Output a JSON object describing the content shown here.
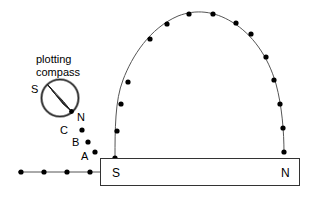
{
  "figure": {
    "caption": {
      "line1": "plotting",
      "line2": "compass"
    },
    "compass": {
      "south_label": "S",
      "north_label": "N",
      "center": {
        "x": 60,
        "y": 98
      },
      "radius": 18,
      "needle_colour": "#1a1a1a",
      "rim_colour": "#333333",
      "needle_from": {
        "x": 48,
        "y": 85
      },
      "needle_to": {
        "x": 72,
        "y": 112
      }
    },
    "magnet": {
      "south_label": "S",
      "north_label": "N",
      "x": 100,
      "y": 158,
      "width": 200,
      "height": 28,
      "stroke": "#333333",
      "fill": "#ffffff"
    },
    "plot_points": {
      "label_c": "C",
      "label_b": "B",
      "label_a": "A",
      "marker_colour": "#000000",
      "marker_radius": 2.6,
      "trail": [
        {
          "x": 82,
          "y": 130,
          "label": "C"
        },
        {
          "x": 88,
          "y": 142,
          "label": "B"
        },
        {
          "x": 95,
          "y": 152,
          "label": "A"
        }
      ],
      "label_positions": [
        {
          "label": "C",
          "x": 64,
          "y": 130
        },
        {
          "label": "B",
          "x": 76,
          "y": 142
        },
        {
          "label": "A",
          "x": 84,
          "y": 157
        }
      ]
    },
    "field_line_arc": {
      "stroke": "#555555",
      "stroke_width": 1,
      "points": [
        {
          "x": 115,
          "y": 158
        },
        {
          "x": 117,
          "y": 131
        },
        {
          "x": 121,
          "y": 104
        },
        {
          "x": 128,
          "y": 82
        },
        {
          "x": 150,
          "y": 39
        },
        {
          "x": 167,
          "y": 24
        },
        {
          "x": 189,
          "y": 14
        },
        {
          "x": 213,
          "y": 14
        },
        {
          "x": 236,
          "y": 23
        },
        {
          "x": 251,
          "y": 34
        },
        {
          "x": 266,
          "y": 57
        },
        {
          "x": 274,
          "y": 80
        },
        {
          "x": 280,
          "y": 104
        },
        {
          "x": 283,
          "y": 128
        },
        {
          "x": 284,
          "y": 152
        }
      ]
    },
    "field_line_straight": {
      "stroke": "#555555",
      "stroke_width": 1,
      "y": 172,
      "x_start": 18,
      "x_end": 100,
      "points": [
        {
          "x": 21,
          "y": 172
        },
        {
          "x": 44,
          "y": 172
        },
        {
          "x": 67,
          "y": 172
        },
        {
          "x": 90,
          "y": 172
        }
      ]
    }
  }
}
